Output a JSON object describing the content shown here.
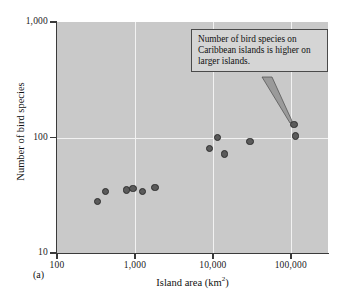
{
  "panel_label": "(a)",
  "callout": {
    "text": "Number of bird species on Caribbean islands is higher on larger islands."
  },
  "axes": {
    "x_title_main": "Island area (km",
    "x_title_sup": "2",
    "x_title_close": ")",
    "y_title": "Number of bird species",
    "x_ticks": [
      "100",
      "1,000",
      "10,000",
      "100,000"
    ],
    "y_ticks": [
      "1,000",
      "100",
      "10"
    ]
  },
  "chart_data": {
    "type": "scatter",
    "title": "",
    "xlabel": "Island area (km^2)",
    "ylabel": "Number of bird species",
    "xscale": "log",
    "yscale": "log",
    "xlim": [
      100,
      300000
    ],
    "ylim": [
      10,
      1000
    ],
    "grid": true,
    "grid_color": "#f2f2f2",
    "plot_background": "#c9c9c9",
    "marker_color": "#5a5a5a",
    "marker_edge_color": "#2e2e2e",
    "legend": null,
    "annotations": [
      {
        "text": "Number of bird species on Caribbean islands is higher on larger islands.",
        "points_to": {
          "x": 110000,
          "y": 130
        }
      }
    ],
    "points": [
      {
        "x": 330,
        "y": 28
      },
      {
        "x": 420,
        "y": 34
      },
      {
        "x": 780,
        "y": 35
      },
      {
        "x": 950,
        "y": 36
      },
      {
        "x": 1250,
        "y": 34
      },
      {
        "x": 1800,
        "y": 37
      },
      {
        "x": 9000,
        "y": 80
      },
      {
        "x": 11500,
        "y": 100
      },
      {
        "x": 14000,
        "y": 72
      },
      {
        "x": 30000,
        "y": 92
      },
      {
        "x": 110000,
        "y": 130
      },
      {
        "x": 115000,
        "y": 103
      }
    ],
    "x_tick_values": [
      100,
      1000,
      10000,
      100000
    ],
    "x_tick_labels": [
      "100",
      "1,000",
      "10,000",
      "100,000"
    ],
    "y_tick_values": [
      10,
      100,
      1000
    ],
    "y_tick_labels": [
      "10",
      "100",
      "1,000"
    ]
  }
}
